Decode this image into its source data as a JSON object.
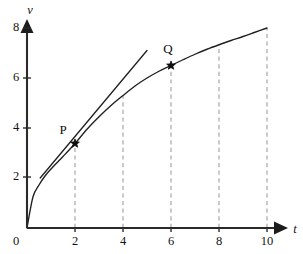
{
  "figure": {
    "title": "",
    "background_color": "#ffffff",
    "curve_color": "#1f1f1f",
    "axis_color": "#2a2a2a",
    "guide_color": "#9a9a9a"
  },
  "chart_data": {
    "type": "line",
    "title": "",
    "xlabel": "t",
    "ylabel": "v",
    "xlim": [
      0,
      10.6
    ],
    "ylim": [
      0,
      8.6
    ],
    "grid": false,
    "legend": "none",
    "x_ticks": [
      0,
      2,
      4,
      6,
      8,
      10
    ],
    "x_tick_labels": [
      "0",
      "2",
      "4",
      "6",
      "8",
      "10"
    ],
    "y_ticks": [
      2,
      4,
      6,
      8
    ],
    "y_tick_labels": [
      "2",
      "4",
      "6",
      "8"
    ],
    "origin_label": "0",
    "series": [
      {
        "name": "velocity-curve",
        "style": "solid",
        "x": [
          0.0,
          0.25,
          0.5,
          0.75,
          1.0,
          1.5,
          2.0,
          2.5,
          3.0,
          3.5,
          4.0,
          4.5,
          5.0,
          5.5,
          6.0,
          6.5,
          7.0,
          7.5,
          8.0,
          8.5,
          9.0,
          9.5,
          10.0
        ],
        "y": [
          0.0,
          1.25,
          1.72,
          2.08,
          2.36,
          2.86,
          3.38,
          3.95,
          4.45,
          4.9,
          5.3,
          5.68,
          6.0,
          6.27,
          6.5,
          6.73,
          6.95,
          7.15,
          7.33,
          7.5,
          7.66,
          7.83,
          8.0
        ]
      },
      {
        "name": "tangent-at-P",
        "style": "solid",
        "x": [
          0.55,
          5.0
        ],
        "y": [
          2.0,
          7.1
        ]
      }
    ],
    "dashed_guides": [
      {
        "x": 2,
        "y_top": 3.38
      },
      {
        "x": 4,
        "y_top": 5.3
      },
      {
        "x": 6,
        "y_top": 6.5
      },
      {
        "x": 8,
        "y_top": 7.33
      },
      {
        "x": 10,
        "y_top": 8.0
      }
    ],
    "annotations": [
      {
        "label": "P",
        "x": 2,
        "y": 3.38,
        "marker": "star",
        "label_dx": -12,
        "label_dy": -10
      },
      {
        "label": "Q",
        "x": 6,
        "y": 6.5,
        "marker": "star",
        "label_dx": -3,
        "label_dy": -13
      }
    ]
  }
}
